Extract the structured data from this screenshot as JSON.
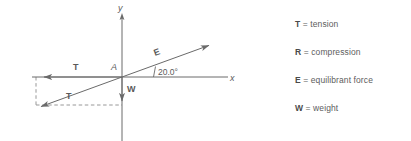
{
  "figure": {
    "axes": {
      "x_label": "x",
      "y_label": "y",
      "origin_label": "A"
    },
    "angle": {
      "value": "20.0°",
      "between": "E and +x axis"
    },
    "vectors": [
      {
        "name": "vector-T",
        "label": "T",
        "direction": "left along negative x axis"
      },
      {
        "name": "vector-E",
        "label": "E",
        "direction": "up and to the right at 20.0 degrees"
      },
      {
        "name": "vector-R",
        "label": "R",
        "direction": "down and to the left at 20.0 degrees below negative x axis"
      },
      {
        "name": "vector-W",
        "label": "W",
        "direction": "straight down along negative y axis"
      }
    ],
    "stroke_color": "#6a6a6a",
    "text_color": "#5a5a5a"
  },
  "legend": {
    "items": [
      {
        "symbol": "T",
        "equals": "= tension"
      },
      {
        "symbol": "R",
        "equals": "= compression"
      },
      {
        "symbol": "E",
        "equals": "= equilibrant force"
      },
      {
        "symbol": "W",
        "equals": "= weight"
      }
    ]
  }
}
